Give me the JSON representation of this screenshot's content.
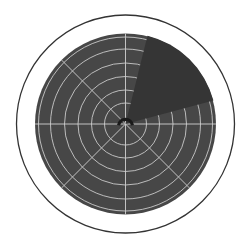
{
  "radar": {
    "center": {
      "x": 125.5,
      "y": 124
    },
    "bezel": {
      "radius": 109,
      "stroke": "#333333",
      "stroke_width": 1.3,
      "fill": "#ffffff"
    },
    "scope": {
      "radius": 90.5,
      "fill": "#474747"
    },
    "rings": {
      "radii": [
        21,
        34,
        47.5,
        61,
        75,
        87
      ],
      "color": "#c9c9c9",
      "width": 0.9
    },
    "spokes": {
      "angles_deg": [
        0,
        45,
        90,
        135,
        180,
        225,
        270,
        315
      ],
      "color": "#d0d0d0",
      "width": 0.9
    },
    "sweep": {
      "start_bearing_deg": 14,
      "end_bearing_deg": 75,
      "fill": "#353535"
    },
    "hub": {
      "arc_radius": 7,
      "arc_width": 3.2,
      "arc_color": "#1a1a1a",
      "start_bearing_deg": -100,
      "end_bearing_deg": 100
    }
  }
}
